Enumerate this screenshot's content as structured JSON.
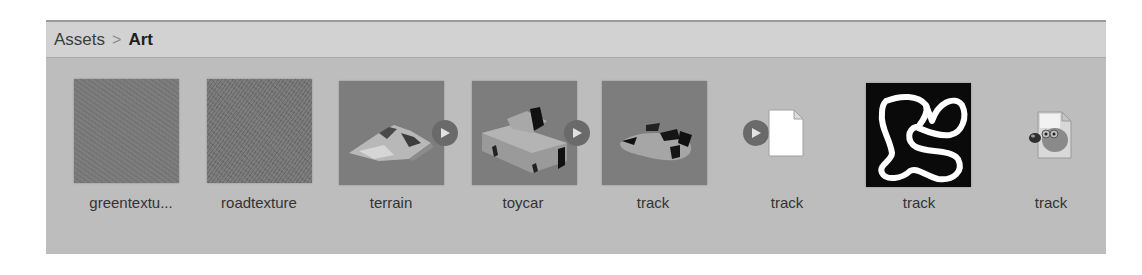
{
  "breadcrumb": {
    "items": [
      {
        "label": "Assets",
        "current": false
      },
      {
        "label": "Art",
        "current": true
      }
    ],
    "separator": ">"
  },
  "assets": [
    {
      "label": "greentextu...",
      "type": "texture",
      "icon": "green-texture-thumbnail",
      "expandable": false
    },
    {
      "label": "roadtexture",
      "type": "texture",
      "icon": "road-texture-thumbnail",
      "expandable": false
    },
    {
      "label": "terrain",
      "type": "model",
      "icon": "terrain-model-thumbnail",
      "expandable": true
    },
    {
      "label": "toycar",
      "type": "model",
      "icon": "toycar-model-thumbnail",
      "expandable": true
    },
    {
      "label": "track",
      "type": "model",
      "icon": "track-model-thumbnail",
      "expandable": true
    },
    {
      "label": "track",
      "type": "file",
      "icon": "blank-document-icon",
      "expandable": false
    },
    {
      "label": "track",
      "type": "image",
      "icon": "track-image-thumbnail",
      "expandable": false
    },
    {
      "label": "track",
      "type": "gimp-file",
      "icon": "gimp-file-icon",
      "expandable": false
    }
  ],
  "colors": {
    "panel_bg": "#bdbdbd",
    "header_bg": "#d2d2d2",
    "thumb_bg": "#7b7b7b",
    "play_button": "#6a6a6a",
    "label_text": "#333333"
  }
}
